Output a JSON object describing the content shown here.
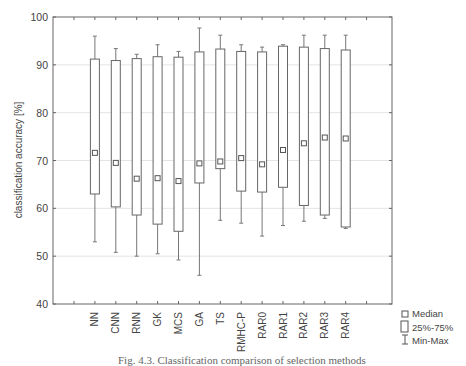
{
  "chart_data": {
    "type": "boxplot",
    "title": "",
    "xlabel": "",
    "ylabel": "classification accuracy [%]",
    "ylim": [
      40,
      100
    ],
    "yticks": [
      40,
      50,
      60,
      70,
      80,
      90,
      100
    ],
    "grid": true,
    "categories": [
      "NN",
      "CNN",
      "RNN",
      "GK",
      "MCS",
      "GA",
      "TS",
      "RMHC-P",
      "RAR0",
      "RAR1",
      "RAR2",
      "RAR3",
      "RAR4"
    ],
    "series": [
      {
        "name": "Median",
        "values": [
          71.6,
          69.5,
          66.2,
          66.3,
          65.7,
          69.4,
          69.8,
          70.5,
          69.2,
          72.2,
          73.6,
          74.8,
          74.6
        ]
      },
      {
        "name": "25%",
        "values": [
          63.0,
          60.3,
          58.6,
          56.7,
          55.2,
          65.3,
          68.3,
          63.6,
          63.4,
          64.4,
          60.6,
          58.6,
          56.1
        ]
      },
      {
        "name": "75%",
        "values": [
          91.2,
          90.9,
          91.3,
          91.7,
          91.6,
          92.7,
          93.3,
          92.8,
          92.7,
          93.9,
          93.7,
          93.4,
          93.1
        ]
      },
      {
        "name": "Min",
        "values": [
          53.0,
          50.8,
          50.0,
          50.5,
          49.2,
          46.0,
          57.5,
          56.9,
          54.2,
          56.4,
          57.3,
          57.9,
          55.8
        ]
      },
      {
        "name": "Max",
        "values": [
          96.0,
          93.4,
          92.2,
          94.2,
          92.8,
          97.7,
          96.2,
          94.2,
          93.7,
          94.2,
          96.2,
          96.2,
          96.2
        ]
      }
    ],
    "legend": {
      "position": "right-bottom",
      "entries": [
        "Median",
        "25%-75%",
        "Min-Max"
      ]
    }
  },
  "caption": "Fig. 4.3. Classification comparison of selection methods"
}
